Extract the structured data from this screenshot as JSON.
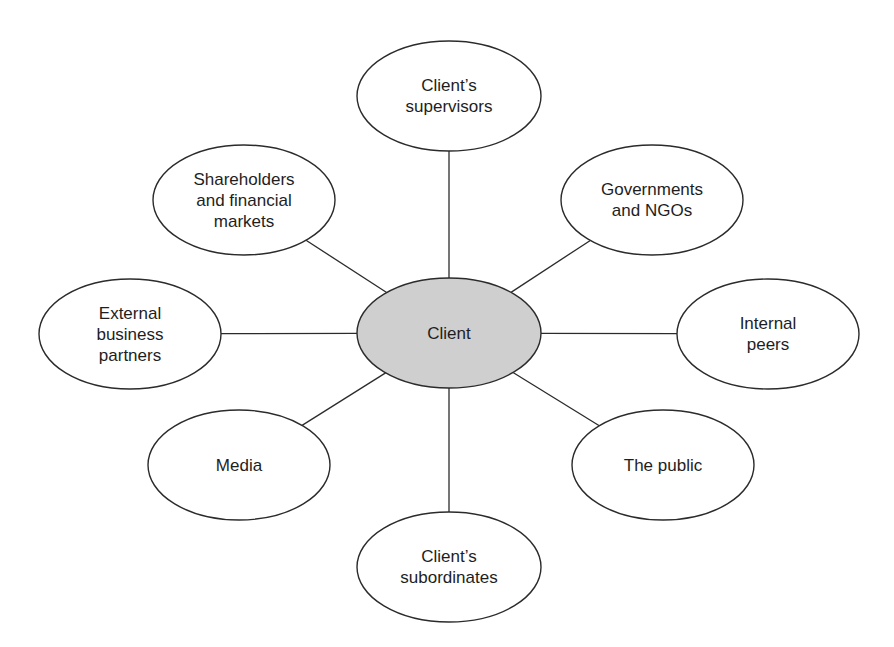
{
  "diagram": {
    "type": "hub-and-spoke stakeholder diagram",
    "center": {
      "id": "client",
      "label": "Client",
      "fill": "#cfcfcf",
      "cx": 449,
      "cy": 333,
      "rx": 92,
      "ry": 55
    },
    "node_fill": "#ffffff",
    "stroke": "#2b2b2b",
    "nodes": [
      {
        "id": "supervisors",
        "lines": [
          "Client’s",
          "supervisors"
        ],
        "cx": 449,
        "cy": 96,
        "rx": 92,
        "ry": 55
      },
      {
        "id": "governments",
        "lines": [
          "Governments",
          "and NGOs"
        ],
        "cx": 652,
        "cy": 200,
        "rx": 91,
        "ry": 55
      },
      {
        "id": "internal-peers",
        "lines": [
          "Internal",
          "peers"
        ],
        "cx": 768,
        "cy": 334,
        "rx": 91,
        "ry": 55
      },
      {
        "id": "the-public",
        "lines": [
          "The public"
        ],
        "cx": 663,
        "cy": 465,
        "rx": 91,
        "ry": 55
      },
      {
        "id": "subordinates",
        "lines": [
          "Client’s",
          "subordinates"
        ],
        "cx": 449,
        "cy": 567,
        "rx": 92,
        "ry": 55
      },
      {
        "id": "media",
        "lines": [
          "Media"
        ],
        "cx": 239,
        "cy": 465,
        "rx": 91,
        "ry": 55
      },
      {
        "id": "external-partners",
        "lines": [
          "External",
          "business",
          "partners"
        ],
        "cx": 130,
        "cy": 334,
        "rx": 91,
        "ry": 55
      },
      {
        "id": "shareholders",
        "lines": [
          "Shareholders",
          "and financial",
          "markets"
        ],
        "cx": 244,
        "cy": 200,
        "rx": 91,
        "ry": 55
      }
    ],
    "edges": [
      {
        "from": "client",
        "to": "supervisors"
      },
      {
        "from": "client",
        "to": "governments"
      },
      {
        "from": "client",
        "to": "internal-peers"
      },
      {
        "from": "client",
        "to": "the-public"
      },
      {
        "from": "client",
        "to": "subordinates"
      },
      {
        "from": "client",
        "to": "media"
      },
      {
        "from": "client",
        "to": "external-partners"
      },
      {
        "from": "client",
        "to": "shareholders"
      }
    ]
  }
}
